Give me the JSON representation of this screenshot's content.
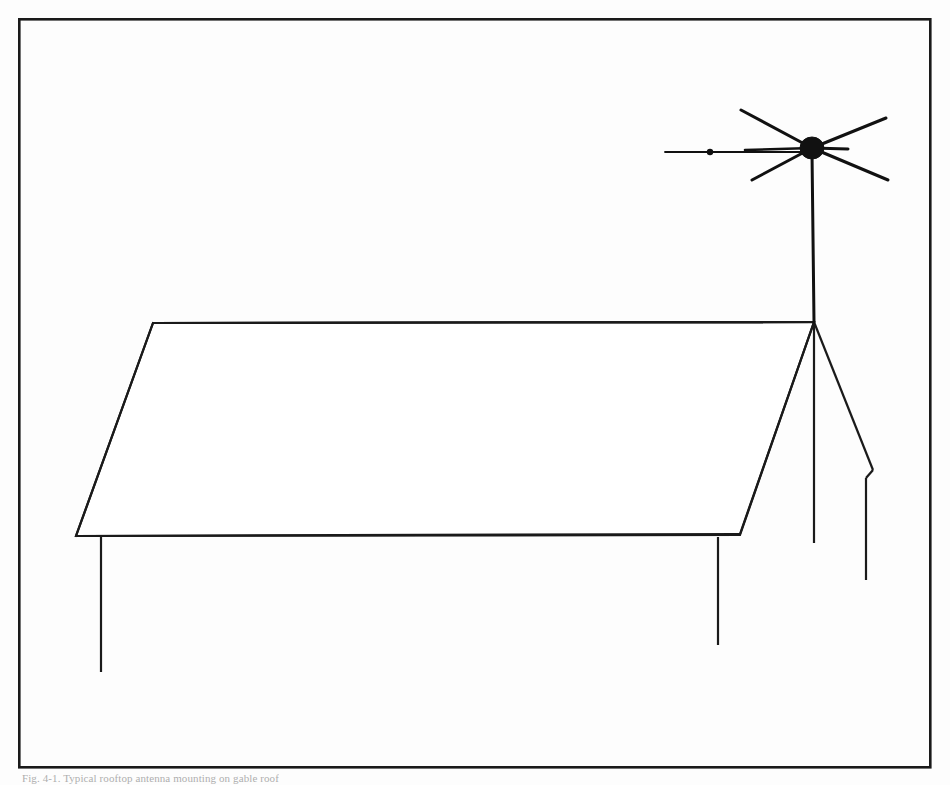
{
  "figure": {
    "caption": "Fig. 4-1. Typical rooftop antenna mounting on gable roof",
    "background_color": "#fdfdfd",
    "line_color": "#1a1a1a",
    "border": {
      "label": "figure-frame",
      "x": 18,
      "y": 18,
      "width": 912,
      "height": 749,
      "stroke_width": 2.6
    },
    "drawing_type": "line-drawing",
    "parts": [
      {
        "name": "roof-plane",
        "label": "Gable roof surface",
        "points": "153,323 814,322 740,535 76,536",
        "stroke_width": 2.2,
        "fill": "none"
      },
      {
        "name": "roof-ridge",
        "label": "Ridge line",
        "x1": 153,
        "y1": 323,
        "x2": 814,
        "y2": 322,
        "stroke_width": 2.2
      },
      {
        "name": "roof-left-rake",
        "label": "Left rake edge",
        "x1": 153,
        "y1": 323,
        "x2": 76,
        "y2": 536,
        "stroke_width": 2.2
      },
      {
        "name": "roof-eave",
        "label": "Front eave line",
        "x1": 76,
        "y1": 536,
        "x2": 740,
        "y2": 534,
        "stroke_width": 2.2
      },
      {
        "name": "roof-right-rake",
        "label": "Right rake edge",
        "x1": 740,
        "y1": 534,
        "x2": 814,
        "y2": 322,
        "stroke_width": 2.2
      },
      {
        "name": "gable-right-slope",
        "label": "Right gable slope",
        "x1": 814,
        "y1": 322,
        "x2": 873,
        "y2": 470,
        "stroke_width": 2.2
      },
      {
        "name": "gable-notch",
        "label": "Eave return notch",
        "points": "873,470 866,478",
        "stroke_width": 2.2
      },
      {
        "name": "gable-corner-post",
        "label": "Right corner downspout",
        "x1": 866,
        "y1": 478,
        "x2": 866,
        "y2": 580,
        "stroke_width": 2.2
      },
      {
        "name": "wall-corner-line",
        "label": "Rear wall corner line",
        "x1": 814,
        "y1": 322,
        "x2": 814,
        "y2": 543,
        "stroke_width": 2.2
      },
      {
        "name": "post-left",
        "label": "Left support post",
        "x1": 101,
        "y1": 537,
        "x2": 101,
        "y2": 672,
        "stroke_width": 2.2
      },
      {
        "name": "post-right",
        "label": "Right support post",
        "x1": 718,
        "y1": 537,
        "x2": 718,
        "y2": 645,
        "stroke_width": 2.2
      }
    ],
    "antenna": {
      "name": "tv-antenna",
      "label": "Television antenna assembly",
      "mast": {
        "name": "antenna-mast",
        "x1": 812,
        "y1": 158,
        "x2": 814,
        "y2": 322,
        "stroke_width": 3.0
      },
      "hub": {
        "name": "antenna-hub",
        "cx": 812,
        "cy": 148,
        "rx": 12,
        "ry": 11,
        "fill": "#111111"
      },
      "elements": [
        {
          "name": "element-upper-left",
          "x1": 812,
          "y1": 148,
          "x2": 741,
          "y2": 110,
          "stroke_width": 3.0
        },
        {
          "name": "element-mid-left",
          "x1": 812,
          "y1": 148,
          "x2": 745,
          "y2": 150,
          "stroke_width": 2.6
        },
        {
          "name": "element-lower-left",
          "x1": 812,
          "y1": 148,
          "x2": 752,
          "y2": 180,
          "stroke_width": 3.0
        },
        {
          "name": "element-upper-right",
          "x1": 812,
          "y1": 148,
          "x2": 886,
          "y2": 118,
          "stroke_width": 3.0
        },
        {
          "name": "element-mid-right",
          "x1": 812,
          "y1": 148,
          "x2": 848,
          "y2": 149,
          "stroke_width": 3.0
        },
        {
          "name": "element-lower-right",
          "x1": 812,
          "y1": 148,
          "x2": 888,
          "y2": 180,
          "stroke_width": 3.0
        }
      ],
      "lead_in": {
        "name": "antenna-lead-in-wire",
        "label": "Lead-in transmission line",
        "x1": 812,
        "y1": 152,
        "x2": 665,
        "y2": 152,
        "stroke_width": 1.6,
        "node": {
          "name": "lead-in-standoff",
          "cx": 710,
          "cy": 152,
          "r": 3.2,
          "fill": "#111111"
        }
      }
    }
  }
}
